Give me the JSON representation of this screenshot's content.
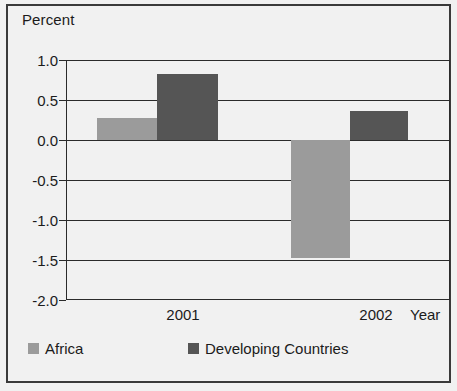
{
  "chart_data": {
    "type": "bar",
    "title": "",
    "subtitle": "",
    "xlabel": "Year",
    "ylabel": "Percent",
    "categories": [
      "2001",
      "2002"
    ],
    "series": [
      {
        "name": "Africa",
        "color": "#9b9b9b",
        "values": [
          0.27,
          -1.47
        ]
      },
      {
        "name": "Developing Countries",
        "color": "#555555",
        "values": [
          0.83,
          0.36
        ]
      }
    ],
    "ylim": [
      -2.0,
      1.0
    ],
    "yticks": [
      1.0,
      0.5,
      0.0,
      -0.5,
      -1.0,
      -1.5,
      -2.0
    ],
    "ytick_labels": [
      "1.0",
      "0.5",
      "0.0",
      "-0.5",
      "-1.0",
      "-1.5",
      "-2.0"
    ],
    "grid": true,
    "legend_position": "bottom-left",
    "legend": [
      "Africa",
      "Developing Countries"
    ]
  },
  "axes": {
    "y_title": "Percent",
    "x_title": "Year"
  },
  "yticks": [
    {
      "label": "1.0"
    },
    {
      "label": "0.5"
    },
    {
      "label": "0.0"
    },
    {
      "label": "-0.5"
    },
    {
      "label": "-1.0"
    },
    {
      "label": "-1.5"
    },
    {
      "label": "-2.0"
    }
  ],
  "xticks": [
    {
      "label": "2001"
    },
    {
      "label": "2002"
    }
  ],
  "legend": {
    "entries": [
      {
        "label": "Africa",
        "color": "#9b9b9b"
      },
      {
        "label": "Developing Countries",
        "color": "#555555"
      }
    ]
  }
}
